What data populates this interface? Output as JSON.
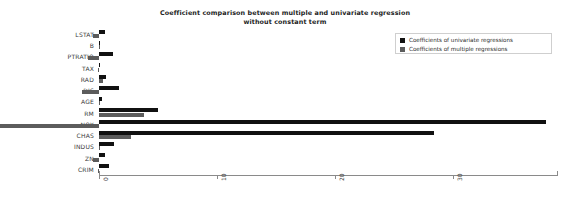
{
  "chart_data": {
    "type": "bar",
    "orientation": "horizontal",
    "grouped": true,
    "title": "Coefficient comparison between multiple and univariate regression\nwithout constant term",
    "title_line1": "Coefficient comparison between multiple and univariate regression",
    "title_line2": "without constant term",
    "xlabel": "",
    "ylabel": "",
    "xlim": [
      -2.2,
      38.0
    ],
    "xticks": [
      0,
      10,
      20,
      30
    ],
    "xticklabels": [
      "0",
      "10",
      "20",
      "30"
    ],
    "grid": false,
    "legend_position": "upper right",
    "categories": [
      "CRIM",
      "ZN",
      "INDUS",
      "CHAS",
      "NOX",
      "RM",
      "AGE",
      "DIS",
      "RAD",
      "TAX",
      "PTRATIO",
      "B",
      "LSTAT"
    ],
    "categories_top_to_bottom": [
      "LSTAT",
      "B",
      "PTRATIO",
      "TAX",
      "RAD",
      "DIS",
      "AGE",
      "RM",
      "NOX",
      "CHAS",
      "INDUS",
      "ZN",
      "CRIM"
    ],
    "series": [
      {
        "name": "Coefficients of univariate regressions",
        "color": "#111111",
        "values": [
          0.86,
          0.48,
          1.26,
          28.4,
          37.9,
          4.97,
          0.24,
          1.69,
          0.63,
          0.06,
          1.19,
          0.06,
          0.55
        ]
      },
      {
        "name": "Coefficients of multiple regressions",
        "color": "#5c5c5c",
        "values": [
          -0.11,
          -0.48,
          0.05,
          2.69,
          -17.77,
          3.81,
          0.01,
          -1.48,
          0.31,
          -0.01,
          -0.95,
          0.01,
          -0.52
        ]
      }
    ],
    "legend": [
      {
        "label": "Coefficients of univariate regressions",
        "color": "#111111"
      },
      {
        "label": "Coefficients of multiple regressions",
        "color": "#5c5c5c"
      }
    ]
  },
  "axis": {
    "tick_values": [
      0,
      10,
      20,
      30
    ]
  }
}
